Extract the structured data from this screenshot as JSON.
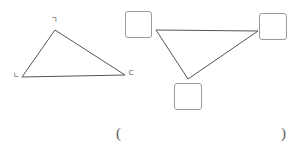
{
  "page": {
    "width": 300,
    "height": 155,
    "background_color": "#ffffff",
    "stroke_color": "#555555",
    "box_border_color": "#9a9a9a",
    "label_color": "#3d3d3d"
  },
  "figures": {
    "left_triangle": {
      "name": "labeled-triangle",
      "vertices": [
        {
          "id": "apex",
          "x": 55,
          "y": 30
        },
        {
          "id": "bottom-left",
          "x": 22,
          "y": 77
        },
        {
          "id": "bottom-right",
          "x": 125,
          "y": 75
        }
      ],
      "labels": [
        {
          "id": "apex-label",
          "text": "ㄱ",
          "x": 51,
          "y": 17
        },
        {
          "id": "bottom-left-label",
          "text": "ㄴ",
          "x": 13,
          "y": 72
        },
        {
          "id": "bottom-right-label",
          "text": "ㄷ",
          "x": 128,
          "y": 70
        }
      ]
    },
    "right_triangle": {
      "name": "answer-triangle",
      "vertices": [
        {
          "id": "top-left",
          "x": 156,
          "y": 30
        },
        {
          "id": "top-right",
          "x": 258,
          "y": 31
        },
        {
          "id": "bottom",
          "x": 188,
          "y": 79
        }
      ],
      "boxes": [
        {
          "id": "box-top-left",
          "x": 125,
          "y": 11,
          "width": 27,
          "height": 27,
          "value": ""
        },
        {
          "id": "box-top-right",
          "x": 259,
          "y": 13,
          "width": 28,
          "height": 27,
          "value": ""
        },
        {
          "id": "box-bottom",
          "x": 174,
          "y": 83,
          "width": 28,
          "height": 27,
          "value": ""
        }
      ]
    }
  },
  "answer_blank": {
    "open_paren": "(",
    "close_paren": ")",
    "value": ""
  }
}
